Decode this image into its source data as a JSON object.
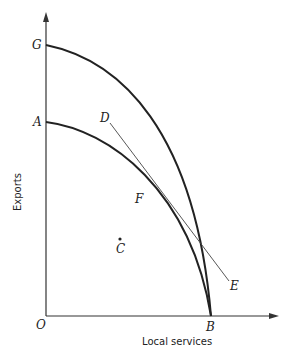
{
  "diagram": {
    "type": "production-possibility-frontier",
    "axes": {
      "x_label": "Local services",
      "y_label": "Exports",
      "origin_label": "O"
    },
    "curves": [
      {
        "name": "outer-frontier",
        "from": "G",
        "to": "B"
      },
      {
        "name": "inner-frontier",
        "from": "A",
        "to": "B"
      }
    ],
    "lines": [
      {
        "name": "tangent-line",
        "from": "D",
        "to": "E",
        "tangent_at": "F"
      }
    ],
    "points": {
      "G": "G",
      "A": "A",
      "D": "D",
      "F": "F",
      "C": "C",
      "E": "E",
      "B": "B",
      "O": "O"
    },
    "colors": {
      "ink": "#222222",
      "thin_line": "#444444",
      "background": "#ffffff"
    }
  }
}
